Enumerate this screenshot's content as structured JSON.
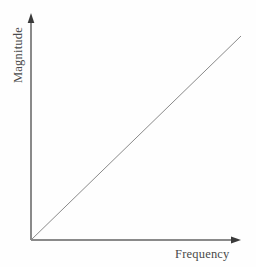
{
  "chart_data": {
    "type": "line",
    "title": "",
    "xlabel": "Frequency",
    "ylabel": "Magnitude",
    "x": [
      0,
      1
    ],
    "values": [
      0,
      1
    ],
    "series": [
      {
        "name": "magnitude-vs-frequency",
        "x": [
          0,
          1
        ],
        "values": [
          0,
          1
        ]
      }
    ],
    "xlim": [
      0,
      1
    ],
    "ylim": [
      0,
      1
    ],
    "grid": false,
    "legend": false,
    "xtick_labels": [],
    "ytick_labels": [],
    "annotations": [],
    "colors": {
      "background": "#fefefe",
      "axis": "#8a8a8a",
      "arrow": "#3a3a3a",
      "line": "#8a8a8a",
      "label_text": "#4a4a4a"
    }
  },
  "axes": {
    "x_axis_name": "Frequency",
    "y_axis_name": "Magnitude",
    "origin": {
      "x": 31,
      "y": 240
    },
    "x_end": {
      "x": 241,
      "y": 240
    },
    "y_end": {
      "x": 31,
      "y": 14
    },
    "line_start": {
      "x": 31,
      "y": 240
    },
    "line_end": {
      "x": 241,
      "y": 36
    }
  }
}
